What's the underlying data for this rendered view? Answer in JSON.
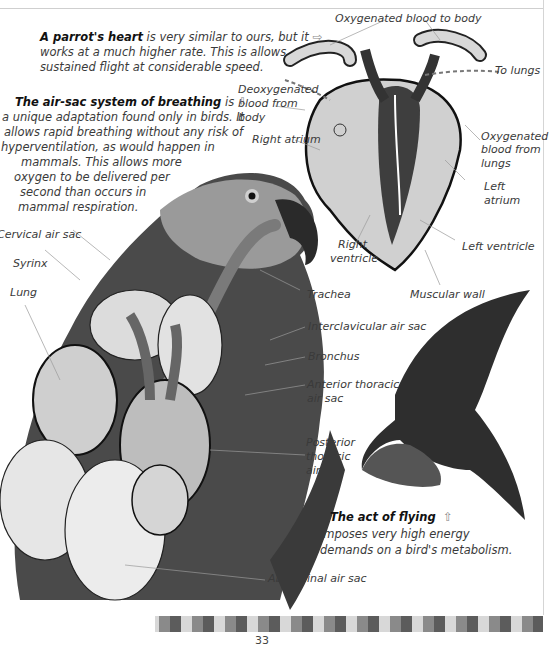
{
  "page_number": "33",
  "intro": {
    "heart": {
      "heading": "A parrot's heart",
      "line1_rest": " is very similar to ours, but it",
      "line2": "works at a much higher rate. This is allows",
      "line3": "sustained flight at considerable speed.",
      "arrow": "⇨"
    },
    "airsac": {
      "heading": "The air-sac system of breathing",
      "line1_rest": " is",
      "arrow": "⇩",
      "lines": [
        "a unique adaptation found only in birds. It",
        "allows rapid breathing without any risk of",
        "hyperventilation, as would happen in",
        "mammals. This allows more",
        "oxygen to be delivered per",
        "second than occurs in",
        "mammal respiration."
      ]
    },
    "flying": {
      "heading": "The act of flying",
      "arrow": "⇧",
      "line2": "imposes very high energy",
      "line3": "demands on a bird's metabolism."
    }
  },
  "heart_labels": {
    "oxy_to_body": "Oxygenated blood to body",
    "to_lungs": "To lungs",
    "deoxy_1": "Deoxygenated",
    "deoxy_2": "blood from",
    "deoxy_3": "body",
    "right_atrium": "Right atrium",
    "oxy_from_lungs_1": "Oxygenated",
    "oxy_from_lungs_2": "blood from",
    "oxy_from_lungs_3": "lungs",
    "left_atrium_1": "Left",
    "left_atrium_2": "atrium",
    "right_ventricle_1": "Right",
    "right_ventricle_2": "ventricle",
    "left_ventricle": "Left ventricle",
    "muscular_wall": "Muscular wall"
  },
  "parrot_labels": {
    "cervical_air_sac": "Cervical air sac",
    "syrinx": "Syrinx",
    "lung": "Lung",
    "trachea": "Trachea",
    "interclavicular_air_sac": "Interclavicular air sac",
    "bronchus": "Bronchus",
    "anterior_thoracic_1": "Anterior thoracic",
    "anterior_thoracic_2": "air sac",
    "posterior_thoracic_1": "Posterior",
    "posterior_thoracic_2": "thoracic",
    "posterior_thoracic_3": "air sac",
    "abdominal_air_sac": "Abdominal air sac"
  },
  "strip_colors": [
    "#8a8a8a",
    "#5c5c5c",
    "#d8d8d8"
  ]
}
